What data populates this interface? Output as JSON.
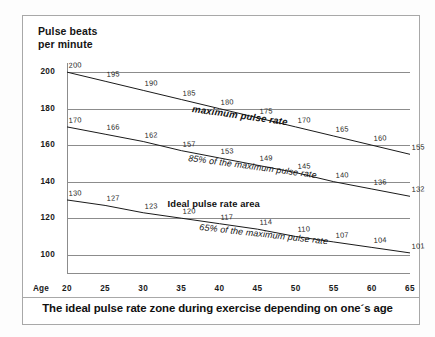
{
  "axis_title": "Pulse beats\nper minute",
  "age_axis_label": "Age",
  "caption": "The ideal pulse rate zone during exercise depending on one´s age",
  "annotations": {
    "maximum": "maximum pulse rate",
    "eightyfive": "85% of the maximum pulse rate",
    "sixtyfive": "65% of the maximum pulse rate",
    "ideal_area": "Ideal pulse rate area"
  },
  "colors": {
    "line": "#1a1a1a",
    "grid": "#8c8c8c",
    "frame": "#a8a8a8",
    "text": "#111111",
    "background": "#ffffff"
  },
  "chart_data": {
    "type": "line",
    "title": "The ideal pulse rate zone during exercise depending on one´s age",
    "xlabel": "Age",
    "ylabel": "Pulse beats per minute",
    "x": [
      20,
      25,
      30,
      35,
      40,
      45,
      50,
      55,
      60,
      65
    ],
    "xticklabels": [
      "20",
      "25",
      "30",
      "35",
      "40",
      "45",
      "50",
      "55",
      "60",
      "65"
    ],
    "yticklabels": [
      "200",
      "180",
      "160",
      "140",
      "120",
      "100"
    ],
    "yticks": [
      200,
      180,
      160,
      140,
      120,
      100
    ],
    "xlim": [
      20,
      65
    ],
    "ylim": [
      90,
      205
    ],
    "grid": true,
    "legend": "inline-labels",
    "series": [
      {
        "name": "maximum pulse rate",
        "values": [
          200,
          195,
          190,
          185,
          180,
          175,
          170,
          165,
          160,
          155
        ]
      },
      {
        "name": "85% of the maximum pulse rate",
        "values": [
          170,
          166,
          162,
          157,
          153,
          149,
          145,
          140,
          136,
          132
        ]
      },
      {
        "name": "65% of the maximum pulse rate",
        "values": [
          130,
          127,
          123,
          120,
          117,
          114,
          110,
          107,
          104,
          101
        ]
      }
    ]
  }
}
